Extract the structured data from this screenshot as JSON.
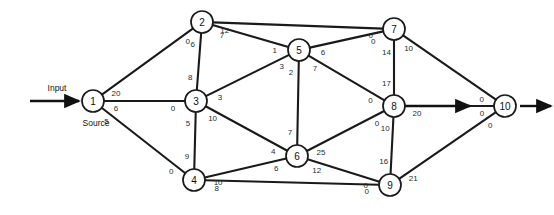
{
  "diagram": {
    "annotations": [
      {
        "name": "input-label",
        "text": "Input",
        "x": 57,
        "y": 88
      },
      {
        "name": "source-label",
        "text": "Source",
        "x": 96,
        "y": 123
      }
    ],
    "nodes": [
      {
        "id": "1",
        "label": "1",
        "x": 93,
        "y": 101,
        "r": 11
      },
      {
        "id": "2",
        "label": "2",
        "x": 202,
        "y": 22,
        "r": 11
      },
      {
        "id": "3",
        "label": "3",
        "x": 196,
        "y": 101,
        "r": 11
      },
      {
        "id": "4",
        "label": "4",
        "x": 194,
        "y": 180,
        "r": 11
      },
      {
        "id": "5",
        "label": "5",
        "x": 299,
        "y": 50,
        "r": 11
      },
      {
        "id": "6",
        "label": "6",
        "x": 297,
        "y": 156,
        "r": 11
      },
      {
        "id": "7",
        "label": "7",
        "x": 394,
        "y": 29,
        "r": 11
      },
      {
        "id": "8",
        "label": "8",
        "x": 394,
        "y": 106,
        "r": 11
      },
      {
        "id": "9",
        "label": "9",
        "x": 390,
        "y": 185,
        "r": 11
      },
      {
        "id": "10",
        "label": "10",
        "x": 505,
        "y": 106,
        "r": 11
      }
    ],
    "edges": [
      {
        "from": "1",
        "to": "2",
        "label_from": "20",
        "label_to": "0"
      },
      {
        "from": "1",
        "to": "3",
        "label_from": "6",
        "label_to": "0"
      },
      {
        "from": "1",
        "to": "4",
        "label_from": "5",
        "label_to": "0"
      },
      {
        "from": "2",
        "to": "7",
        "label_from": "12",
        "label_to": "0"
      },
      {
        "from": "2",
        "to": "5",
        "label_from": "7",
        "label_to": "1"
      },
      {
        "from": "2",
        "to": "3",
        "label_from": "6",
        "label_to": "8"
      },
      {
        "from": "3",
        "to": "5",
        "label_from": "3",
        "label_to": "3"
      },
      {
        "from": "3",
        "to": "6",
        "label_from": "10",
        "label_to": "4"
      },
      {
        "from": "3",
        "to": "4",
        "label_from": "5",
        "label_to": "9"
      },
      {
        "from": "4",
        "to": "6",
        "label_from": "10",
        "label_to": "6"
      },
      {
        "from": "4",
        "to": "9",
        "label_from": "8",
        "label_to": "0"
      },
      {
        "from": "5",
        "to": "7",
        "label_from": "6",
        "label_to": "0"
      },
      {
        "from": "5",
        "to": "8",
        "label_from": "7",
        "label_to": "0"
      },
      {
        "from": "5",
        "to": "6",
        "label_from": "2",
        "label_to": "7"
      },
      {
        "from": "6",
        "to": "8",
        "label_from": "25",
        "label_to": "0"
      },
      {
        "from": "6",
        "to": "9",
        "label_from": "12",
        "label_to": "0"
      },
      {
        "from": "7",
        "to": "8",
        "label_from": "14",
        "label_to": "17"
      },
      {
        "from": "7",
        "to": "10",
        "label_from": "10",
        "label_to": "0"
      },
      {
        "from": "8",
        "to": "10",
        "label_from": "20",
        "label_to": "0"
      },
      {
        "from": "8",
        "to": "9",
        "label_from": "10",
        "label_to": "16"
      },
      {
        "from": "9",
        "to": "10",
        "label_from": "21",
        "label_to": "0"
      }
    ],
    "arrows": [
      {
        "name": "input-arrow",
        "x1": 30,
        "y1": 101,
        "x2": 79,
        "y2": 101
      },
      {
        "name": "output-arrow",
        "x1": 520,
        "y1": 106,
        "x2": 551,
        "y2": 106
      },
      {
        "name": "mid-arrowhead",
        "x1": 405,
        "y1": 106,
        "x2": 470,
        "y2": 106
      }
    ]
  }
}
